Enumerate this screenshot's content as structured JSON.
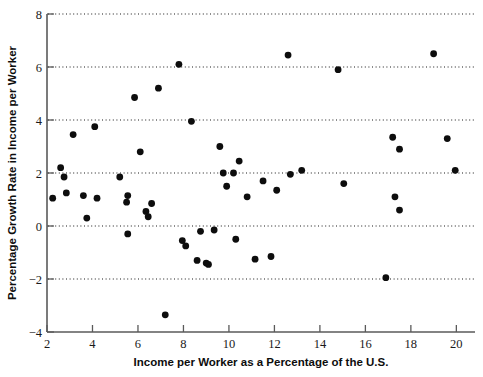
{
  "chart_data": {
    "type": "scatter",
    "title": "",
    "xlabel": "Income per Worker as a Percentage of the U.S.",
    "ylabel": "Percentage Growth Rate in Income per Worker",
    "xlim": [
      2,
      20.6
    ],
    "ylim": [
      -4,
      8
    ],
    "xticks": [
      2,
      4,
      6,
      8,
      10,
      12,
      14,
      16,
      18,
      20
    ],
    "xtick_labels": [
      "2",
      "4",
      "6",
      "8",
      "10",
      "12",
      "14",
      "16",
      "18",
      "20"
    ],
    "yticks": [
      -4,
      -2,
      0,
      2,
      4,
      6,
      8
    ],
    "ytick_labels": [
      "−4",
      "−2",
      "0",
      "2",
      "4",
      "6",
      "8"
    ],
    "gridlines_y": [
      8,
      6,
      4,
      2,
      0,
      -2
    ],
    "grid": true,
    "grid_style": "dotted",
    "legend": "none",
    "marker_color": "#0d0d0d",
    "marker_size": 3.4,
    "points": [
      {
        "x": 2.25,
        "y": 1.05
      },
      {
        "x": 2.6,
        "y": 2.2
      },
      {
        "x": 2.75,
        "y": 1.85
      },
      {
        "x": 2.85,
        "y": 1.25
      },
      {
        "x": 3.15,
        "y": 3.45
      },
      {
        "x": 3.6,
        "y": 1.15
      },
      {
        "x": 3.75,
        "y": 0.3
      },
      {
        "x": 4.1,
        "y": 3.75
      },
      {
        "x": 4.2,
        "y": 1.05
      },
      {
        "x": 5.2,
        "y": 1.85
      },
      {
        "x": 5.55,
        "y": 1.15
      },
      {
        "x": 5.5,
        "y": 0.9
      },
      {
        "x": 5.55,
        "y": -0.3
      },
      {
        "x": 5.85,
        "y": 4.85
      },
      {
        "x": 6.1,
        "y": 2.8
      },
      {
        "x": 6.35,
        "y": 0.55
      },
      {
        "x": 6.45,
        "y": 0.35
      },
      {
        "x": 6.6,
        "y": 0.85
      },
      {
        "x": 6.9,
        "y": 5.2
      },
      {
        "x": 7.2,
        "y": -3.35
      },
      {
        "x": 7.8,
        "y": 6.1
      },
      {
        "x": 7.95,
        "y": -0.55
      },
      {
        "x": 8.1,
        "y": -0.75
      },
      {
        "x": 8.35,
        "y": 3.95
      },
      {
        "x": 8.6,
        "y": -1.3
      },
      {
        "x": 8.75,
        "y": -0.2
      },
      {
        "x": 9.0,
        "y": -1.4
      },
      {
        "x": 9.1,
        "y": -1.45
      },
      {
        "x": 9.35,
        "y": -0.15
      },
      {
        "x": 9.6,
        "y": 3.0
      },
      {
        "x": 9.75,
        "y": 2.0
      },
      {
        "x": 9.9,
        "y": 1.5
      },
      {
        "x": 10.2,
        "y": 2.0
      },
      {
        "x": 10.3,
        "y": -0.5
      },
      {
        "x": 10.45,
        "y": 2.45
      },
      {
        "x": 10.8,
        "y": 1.1
      },
      {
        "x": 11.15,
        "y": -1.25
      },
      {
        "x": 11.5,
        "y": 1.7
      },
      {
        "x": 11.85,
        "y": -1.15
      },
      {
        "x": 12.1,
        "y": 1.35
      },
      {
        "x": 12.6,
        "y": 6.45
      },
      {
        "x": 12.7,
        "y": 1.95
      },
      {
        "x": 13.2,
        "y": 2.1
      },
      {
        "x": 14.8,
        "y": 5.9
      },
      {
        "x": 15.05,
        "y": 1.6
      },
      {
        "x": 16.9,
        "y": -1.95
      },
      {
        "x": 17.2,
        "y": 3.35
      },
      {
        "x": 17.3,
        "y": 1.1
      },
      {
        "x": 17.5,
        "y": 2.9
      },
      {
        "x": 17.5,
        "y": 0.6
      },
      {
        "x": 19.0,
        "y": 6.5
      },
      {
        "x": 19.6,
        "y": 3.3
      },
      {
        "x": 19.95,
        "y": 2.1
      }
    ]
  }
}
